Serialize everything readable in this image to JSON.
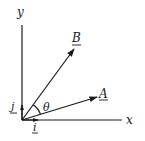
{
  "diagram": {
    "type": "vector-diagram",
    "axes": {
      "x_label": "x",
      "y_label": "y"
    },
    "unit_vectors": {
      "i_label": "i",
      "j_label": "j"
    },
    "vectors": [
      {
        "name": "A",
        "label": "A",
        "underlined": true
      },
      {
        "name": "B",
        "label": "B",
        "underlined": true
      }
    ],
    "angle_label": "θ",
    "colors": {
      "ink": "#1a1a1a",
      "background": "#ffffff"
    }
  }
}
